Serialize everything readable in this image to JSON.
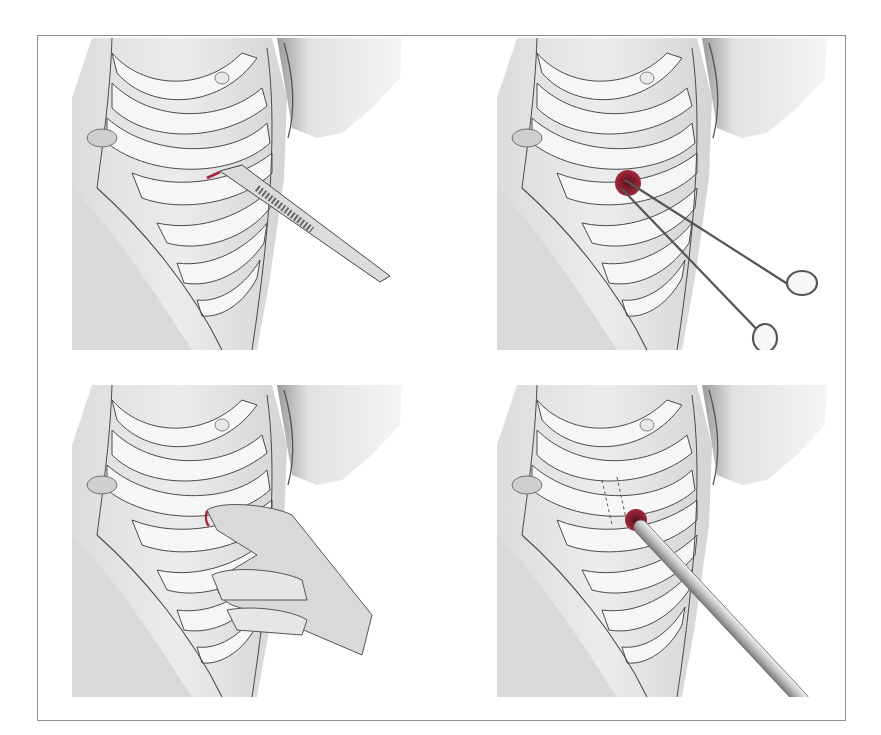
{
  "figure": {
    "panels": [
      {
        "id": "a",
        "label": "a",
        "instrument": "scalpel",
        "step": "skin incision over rib"
      },
      {
        "id": "b",
        "label": "b",
        "instrument": "curved-clamp-forceps",
        "step": "blunt dissection with clamp"
      },
      {
        "id": "c",
        "label": "c",
        "instrument": "gloved-finger",
        "step": "finger sweep into pleural space"
      },
      {
        "id": "d",
        "label": "d",
        "instrument": "chest-tube",
        "step": "tube insertion"
      }
    ],
    "colors": {
      "frame": "#8f8f8f",
      "skin_shading": "#e6e6e6",
      "rib_fill": "#f4f4f4",
      "outline": "#4a4a4a",
      "blood": "#8b1a2b",
      "label": "#1a1a1a"
    }
  }
}
